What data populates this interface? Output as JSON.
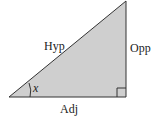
{
  "diagram": {
    "labels": {
      "hypotenuse": "Hyp",
      "opposite": "Opp",
      "adjacent": "Adj",
      "angle": "x"
    },
    "colors": {
      "fill": "#cfcfcf",
      "stroke": "#333333"
    }
  }
}
